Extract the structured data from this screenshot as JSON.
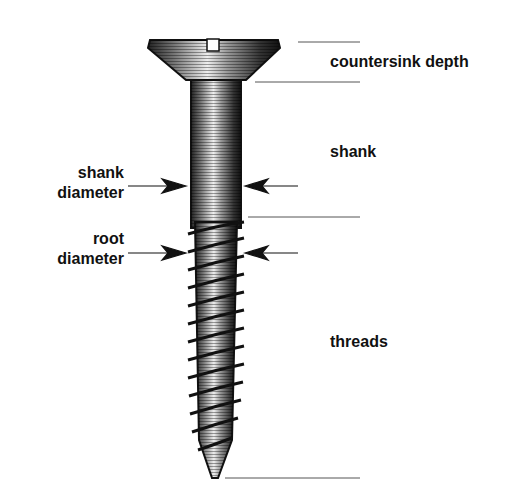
{
  "diagram": {
    "labels": {
      "countersink_depth": "countersink depth",
      "shank": "shank",
      "shank_diameter_line1": "shank",
      "shank_diameter_line2": "diameter",
      "root_diameter_line1": "root",
      "root_diameter_line2": "diameter",
      "threads": "threads"
    },
    "colors": {
      "ink": "#111111",
      "guide_line": "#555555",
      "background": "#ffffff"
    }
  }
}
